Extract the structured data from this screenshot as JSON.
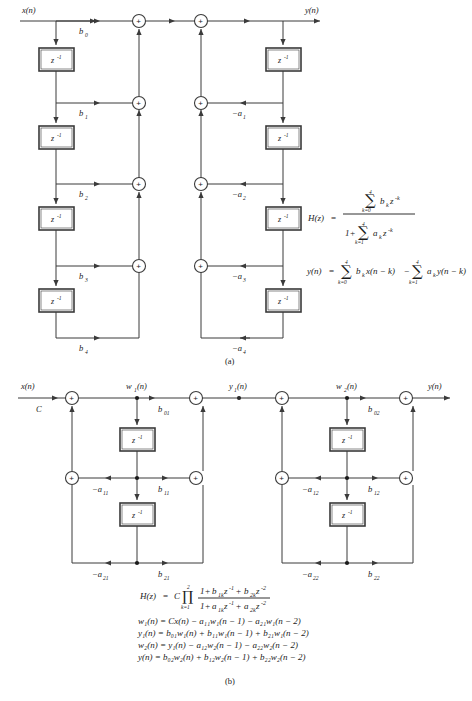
{
  "figure": {
    "panels": [
      {
        "id": "a",
        "label": "(a)",
        "name": "direct-form-ii-fourth-order",
        "input_label": "x(n)",
        "output_label": "y(n)",
        "delay_label": "z",
        "delay_exponent": "-1",
        "feedforward_coeffs": [
          "b",
          "b",
          "b",
          "b",
          "b"
        ],
        "feedforward_subs": [
          "0",
          "1",
          "2",
          "3",
          "4"
        ],
        "feedback_coeffs": [
          "-a",
          "-a",
          "-a",
          "-a"
        ],
        "feedback_subs": [
          "1",
          "2",
          "3",
          "4"
        ],
        "adder_symbol": "+",
        "transfer_function": {
          "lhs": "H(z)",
          "equals": "=",
          "numerator": {
            "sigma": "∑",
            "upper": "4",
            "lower": "k=0",
            "term": "b",
            "term_sub": "k",
            "z": "z",
            "z_sup": "-k"
          },
          "denominator": {
            "one_plus": "1+",
            "sigma": "∑",
            "upper": "4",
            "lower": "k=1",
            "term": "a",
            "term_sub": "k",
            "z": "z",
            "z_sup": "-k"
          }
        },
        "difference_equation": {
          "lhs": "y(n)",
          "equals": "=",
          "first": {
            "sigma": "∑",
            "upper": "4",
            "lower": "k=0",
            "coef": "b",
            "coef_sub": "k",
            "arg": "x(n−k)"
          },
          "minus": "−",
          "second": {
            "sigma": "∑",
            "upper": "4",
            "lower": "k=1",
            "coef": "a",
            "coef_sub": "k",
            "arg": "y(n−k)"
          }
        }
      },
      {
        "id": "b",
        "label": "(b)",
        "name": "cascade-form-biquads",
        "input_label": "x(n)",
        "gain_label": "C",
        "intermediate_labels": [
          "w",
          "y",
          "w"
        ],
        "intermediate_subs": [
          "1",
          "1",
          "2"
        ],
        "intermediate_args": [
          "(n)",
          "(n)",
          "(n)"
        ],
        "output_label": "y(n)",
        "delay_label": "z",
        "delay_exponent": "-1",
        "stage1_coeffs": {
          "b0": "b",
          "b0_sub": "01",
          "b1": "b",
          "b1_sub": "11",
          "b2": "b",
          "b2_sub": "21",
          "a1": "-a",
          "a1_sub": "11",
          "a2": "-a",
          "a2_sub": "21"
        },
        "stage2_coeffs": {
          "b0": "b",
          "b0_sub": "02",
          "b1": "b",
          "b1_sub": "12",
          "b2": "b",
          "b2_sub": "22",
          "a1": "-a",
          "a1_sub": "12",
          "a2": "-a",
          "a2_sub": "22"
        },
        "adder_symbol": "+",
        "transfer_function": {
          "lhs": "H(z)",
          "equals": "=",
          "gain": "C",
          "prod": "∏",
          "upper": "2",
          "lower": "k=1",
          "numerator": "1 + b₁ₖz⁻¹ + b₂ₖz⁻²",
          "denominator": "1 + a₁ₖz⁻¹ + a₂ₖz⁻²",
          "num_parts": {
            "one_plus": "1+",
            "b1": "b",
            "b1_sub": "1k",
            "z1": "z",
            "z1_sup": "-1",
            "plus": "+",
            "b2": "b",
            "b2_sub": "2k",
            "z2": "z",
            "z2_sup": "-2"
          },
          "den_parts": {
            "one_plus": "1+",
            "a1": "a",
            "a1_sub": "1k",
            "z1": "z",
            "z1_sup": "-1",
            "plus": "+",
            "a2": "a",
            "a2_sub": "2k",
            "z2": "z",
            "z2_sup": "-2"
          }
        },
        "difference_equations": [
          "w₁(n) = Cx(n) − a₁₁w₁(n − 1) − a₂₁w₁(n − 2)",
          "y₁(n) = b₀₁w₁(n) + b₁₁w₁(n − 1) + b₂₁w₁(n − 2)",
          "w₂(n) = y₁(n) − a₁₂w₂(n − 1) − a₂₂w₂(n − 2)",
          "y(n) = b₀₂w₂(n) + b₁₂w₂(n − 1) + b₂₂w₂(n − 2)"
        ]
      }
    ],
    "colors": {
      "line": "#3a3a3a",
      "text": "#1a1a1a",
      "background": "#ffffff"
    }
  }
}
